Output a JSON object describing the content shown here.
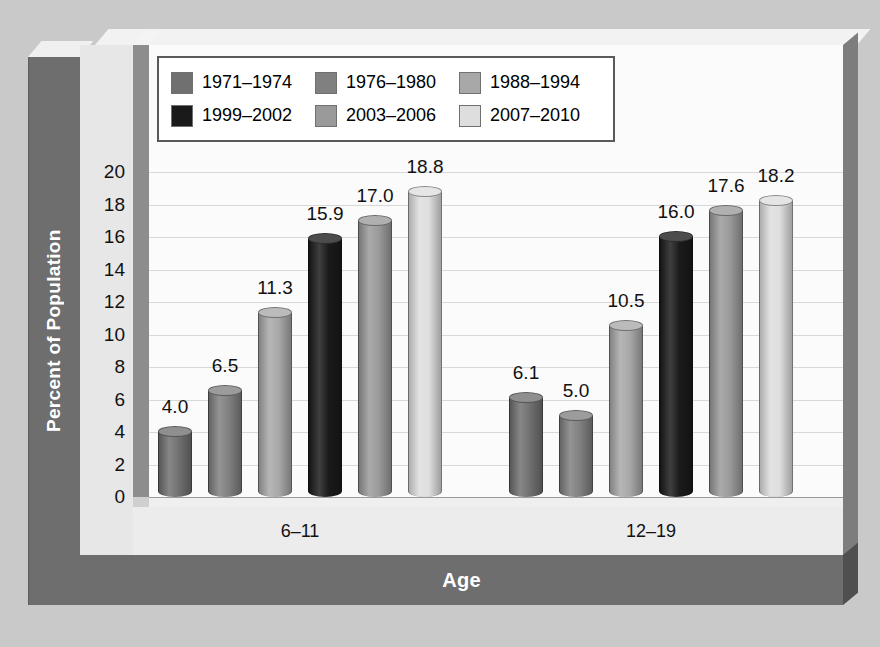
{
  "chart_data": {
    "type": "bar",
    "title": "",
    "xlabel": "Age",
    "ylabel": "Percent of Population",
    "ylim": [
      0,
      20
    ],
    "ytick_step": 2,
    "yticks": [
      "20",
      "18",
      "16",
      "14",
      "12",
      "10",
      "8",
      "6",
      "4",
      "2",
      "0"
    ],
    "grid": true,
    "legend_position": "top-left",
    "categories": [
      "6–11",
      "12–19"
    ],
    "series": [
      {
        "name": "1971–1974",
        "color": "#707070",
        "values": [
          4.0,
          6.1
        ]
      },
      {
        "name": "1976–1980",
        "color": "#808080",
        "values": [
          6.5,
          5.0
        ]
      },
      {
        "name": "1988–1994",
        "color": "#a8a8a8",
        "values": [
          11.3,
          10.5
        ]
      },
      {
        "name": "1999–2002",
        "color": "#1a1a1a",
        "values": [
          15.9,
          16.0
        ]
      },
      {
        "name": "2003–2006",
        "color": "#9a9a9a",
        "values": [
          17.0,
          17.6
        ]
      },
      {
        "name": "2007–2010",
        "color": "#dedede",
        "values": [
          18.8,
          18.2
        ]
      }
    ],
    "value_labels": [
      [
        "4.0",
        "6.5",
        "11.3",
        "15.9",
        "17.0",
        "18.8"
      ],
      [
        "6.1",
        "5.0",
        "10.5",
        "16.0",
        "17.6",
        "18.2"
      ]
    ]
  },
  "style": {
    "outer_background": "#c9c9c9",
    "panel_background": "#e6e6e6",
    "plot_background": "#fbfbfb",
    "axis_band_color": "#6e6e6e",
    "axis_title_text_color": "#ffffff",
    "gridline_color": "#d8d8d8",
    "legend_border_color": "#595959"
  }
}
